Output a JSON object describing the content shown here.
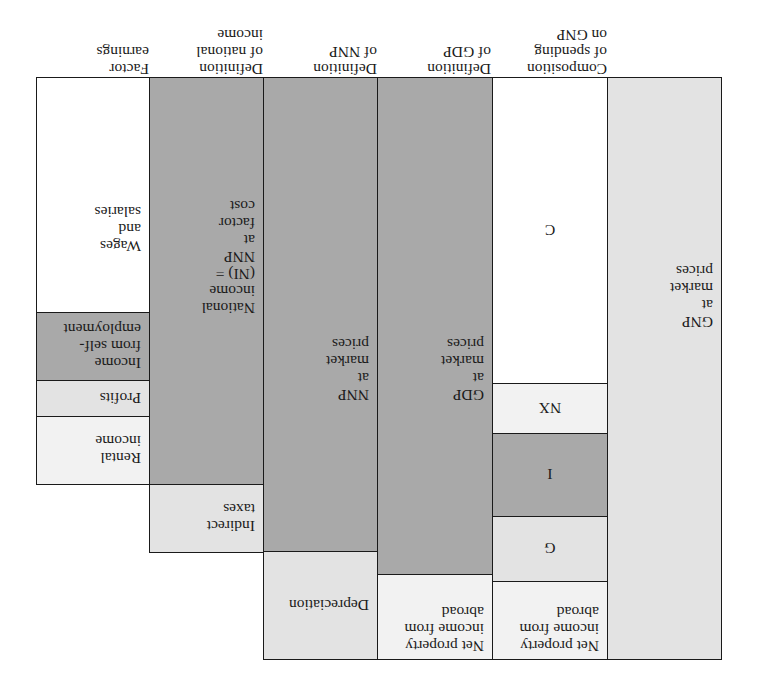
{
  "headers": {
    "gnp": "",
    "composition": "Composition\nof spending\non GNP",
    "gdp": "Definition\nof GDP",
    "nnp": "Definition\nof NNP",
    "ni": "Definition\nof national\nincome",
    "factor": "Factor\nearnings"
  },
  "columns": {
    "gnp": {
      "label": "GNP\nat\nmarket\nprices"
    },
    "composition": {
      "items": [
        {
          "label": "Net property\nincome from\nabroad"
        },
        {
          "label": "G"
        },
        {
          "label": "I"
        },
        {
          "label": "NX"
        },
        {
          "label": "C"
        }
      ]
    },
    "gdp": {
      "items": [
        {
          "label": "Net property\nincome from\nabroad"
        },
        {
          "label": "GDP\nat\nmarket\nprices"
        }
      ]
    },
    "nnp": {
      "items": [
        {
          "label": "Depreciation"
        },
        {
          "label": "NNP\nat\nmarket\nprices"
        }
      ]
    },
    "ni": {
      "items": [
        {
          "label": "Indirect\ntaxes"
        },
        {
          "label": "National\nincome\n(NI) =\nNNP\nat\nfactor\ncost"
        }
      ]
    },
    "factor": {
      "items": [
        {
          "label": "Rental\nincome"
        },
        {
          "label": "Profits"
        },
        {
          "label": "Income\nfrom self-\nemployment"
        },
        {
          "label": "Wages\nand\nsalaries"
        }
      ]
    }
  },
  "colors": {
    "light": "#e3e3e3",
    "mid": "#a9a9a9",
    "white": "#ffffff",
    "pale": "#f2f2f2",
    "border": "#1a1a1a"
  },
  "orientation": "rotated 180 degrees"
}
